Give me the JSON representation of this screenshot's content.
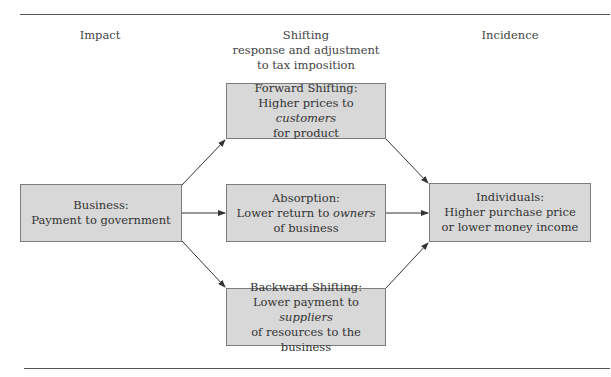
{
  "colors": {
    "box_fill": "#d8d8d8",
    "box_border": "#7c7c7c",
    "arrow": "#333333",
    "rule": "#555555"
  },
  "headers": {
    "impact": "Impact",
    "shifting_title": "Shifting",
    "shifting_sub1": "response and adjustment",
    "shifting_sub2": "to tax imposition",
    "incidence": "Incidence"
  },
  "boxes": {
    "business": {
      "title": "Business:",
      "line1": "Payment to government"
    },
    "forward": {
      "title": "Forward Shifting:",
      "line1_pre": "Higher prices to ",
      "line1_em": "customers",
      "line2": "for product"
    },
    "absorption": {
      "title": "Absorption:",
      "line1_pre": "Lower return to ",
      "line1_em": "owners",
      "line2": "of business"
    },
    "backward": {
      "title": "Backward Shifting:",
      "line1_pre": "Lower payment to ",
      "line1_em": "suppliers",
      "line2": "of resources to the business"
    },
    "individuals": {
      "title": "Individuals:",
      "line1": "Higher purchase price",
      "line2": "or lower money income"
    }
  },
  "arrows": [
    {
      "from": "business",
      "to": "forward"
    },
    {
      "from": "business",
      "to": "absorption"
    },
    {
      "from": "business",
      "to": "backward"
    },
    {
      "from": "forward",
      "to": "individuals"
    },
    {
      "from": "absorption",
      "to": "individuals"
    },
    {
      "from": "backward",
      "to": "individuals"
    }
  ]
}
